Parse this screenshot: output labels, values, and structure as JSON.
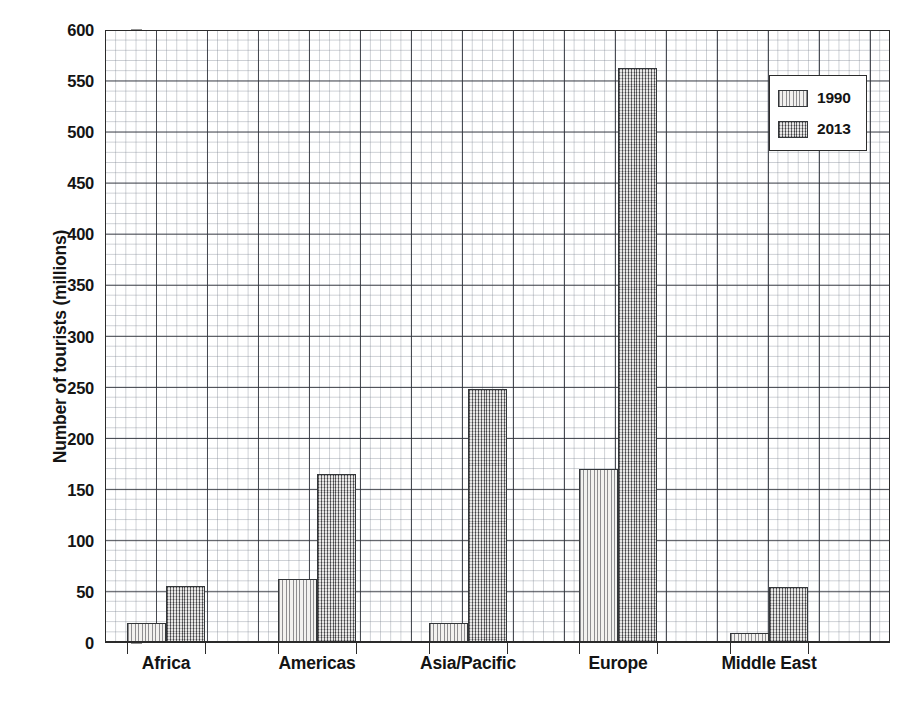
{
  "chart_data": {
    "type": "bar",
    "title": "",
    "xlabel": "",
    "ylabel": "Number of tourists (millions)",
    "categories": [
      "Africa",
      "Americas",
      "Asia/Pacific",
      "Europe",
      "Middle East"
    ],
    "series": [
      {
        "name": "1990",
        "values": [
          20,
          63,
          20,
          170,
          10
        ],
        "fill": "vertical-hatch",
        "color": "#f2f1ef"
      },
      {
        "name": "2013",
        "values": [
          56,
          165,
          249,
          563,
          55
        ],
        "fill": "cross-hatch",
        "color": "#a9a6a4"
      }
    ],
    "ylim": [
      0,
      600
    ],
    "yticks": [
      0,
      50,
      100,
      150,
      200,
      250,
      300,
      350,
      400,
      450,
      500,
      550,
      600
    ],
    "ytick_labels": [
      "0",
      "50",
      "100",
      "150",
      "200",
      "250",
      "300",
      "350",
      "400",
      "450",
      "500",
      "550",
      "600"
    ],
    "grid": true,
    "grid_minor": true,
    "grid_step_major": 50,
    "grid_step_minor": 10,
    "legend_position": "top-right",
    "legend_entries": [
      "1990",
      "2013"
    ]
  },
  "axes": {
    "y_title": "Number of tourists (millions)"
  },
  "legend": {
    "items": [
      {
        "label": "1990"
      },
      {
        "label": "2013"
      }
    ]
  },
  "colors": {
    "axis": "#2b2b2b",
    "grid_major": "#2d3038",
    "grid_minor": "#78808c",
    "series_1990": "#f2f1ef",
    "series_2013": "#a9a6a4",
    "text": "#141414",
    "background": "#ffffff"
  }
}
